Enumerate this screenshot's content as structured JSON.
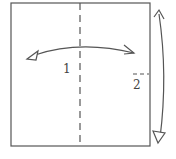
{
  "diagram": {
    "type": "origami-fold-diagram",
    "steps": [
      {
        "label": "1",
        "description": "Vertical valley fold crease at center, fold and unfold left-right"
      },
      {
        "label": "2",
        "description": "Fold top to bottom and unfold, short crease mark at right edge"
      }
    ],
    "colors": {
      "stroke": "#555555",
      "background": "#ffffff"
    }
  }
}
